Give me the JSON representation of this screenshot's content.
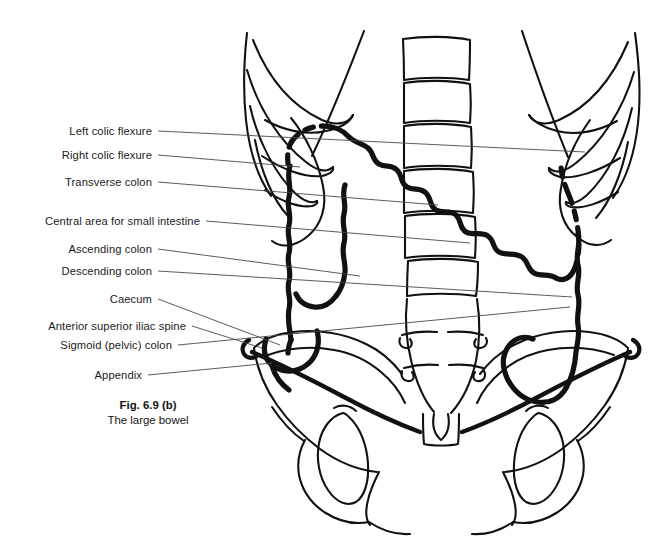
{
  "figure": {
    "caption_title": "Fig. 6.9 (b)",
    "caption_subtitle": "The large bowel",
    "background_color": "#ffffff",
    "ink_color": "#111111",
    "leader_color": "#4a4a4a"
  },
  "labels": [
    {
      "id": "left-colic-flexure",
      "text": "Left colic flexure",
      "text_x": 152,
      "text_y": 131,
      "leader": [
        [
          158,
          131
        ],
        [
          585,
          152
        ]
      ]
    },
    {
      "id": "right-colic-flexure",
      "text": "Right colic flexure",
      "text_x": 152,
      "text_y": 155,
      "leader": [
        [
          158,
          155
        ],
        [
          300,
          167
        ]
      ]
    },
    {
      "id": "transverse-colon",
      "text": "Transverse colon",
      "text_x": 152,
      "text_y": 182,
      "leader": [
        [
          158,
          182
        ],
        [
          438,
          205
        ]
      ]
    },
    {
      "id": "central-area-small-intestine",
      "text": "Central area for small intestine",
      "text_x": 200,
      "text_y": 221,
      "leader": [
        [
          206,
          221
        ],
        [
          470,
          243
        ]
      ]
    },
    {
      "id": "ascending-colon",
      "text": "Ascending colon",
      "text_x": 152,
      "text_y": 249,
      "leader": [
        [
          158,
          249
        ],
        [
          360,
          276
        ]
      ]
    },
    {
      "id": "descending-colon",
      "text": "Descending colon",
      "text_x": 152,
      "text_y": 271,
      "leader": [
        [
          158,
          271
        ],
        [
          572,
          297
        ]
      ]
    },
    {
      "id": "caecum",
      "text": "Caecum",
      "text_x": 152,
      "text_y": 299,
      "leader": [
        [
          158,
          299
        ],
        [
          280,
          345
        ]
      ]
    },
    {
      "id": "anterior-superior-iliac-spine",
      "text": "Anterior superior iliac spine",
      "text_x": 186,
      "text_y": 326,
      "leader": [
        [
          192,
          326
        ],
        [
          262,
          348
        ]
      ]
    },
    {
      "id": "sigmoid-pelvic-colon",
      "text": "Sigmoid (pelvic) colon",
      "text_x": 172,
      "text_y": 345,
      "leader": [
        [
          178,
          345
        ],
        [
          570,
          307
        ]
      ]
    },
    {
      "id": "appendix",
      "text": "Appendix",
      "text_x": 142,
      "text_y": 375,
      "leader": [
        [
          148,
          375
        ],
        [
          272,
          363
        ]
      ]
    }
  ],
  "caption_pos": {
    "x": 148,
    "y": 398
  },
  "anatomy": {
    "parts": [
      "rib-cage-left",
      "rib-cage-right",
      "vertebral-column",
      "sacrum",
      "pelvis-left",
      "pelvis-right",
      "obturator-foramen-left",
      "obturator-foramen-right",
      "symphysis-pubis",
      "costal-margin-left",
      "costal-margin-right",
      "large-bowel-outline"
    ]
  }
}
